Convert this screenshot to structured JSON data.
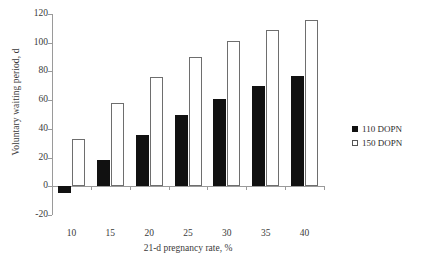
{
  "chart_data": {
    "type": "bar",
    "title": "",
    "xlabel": "21-d pregnancy rate, %",
    "ylabel": "Voluntary waiting period, d",
    "categories": [
      "10",
      "15",
      "20",
      "25",
      "30",
      "35",
      "40"
    ],
    "ylim": [
      -20,
      120
    ],
    "ytick_labels": [
      "-20",
      "0",
      "20",
      "40",
      "60",
      "80",
      "100",
      "120"
    ],
    "ytick_values": [
      -20,
      0,
      20,
      40,
      60,
      80,
      100,
      120
    ],
    "grid": false,
    "legend_position": "right-middle",
    "series": [
      {
        "name": "110 DOPN",
        "style": "filled-black",
        "color": "#111111",
        "values": [
          -5,
          18,
          36,
          50,
          61,
          70,
          77
        ]
      },
      {
        "name": "150 DOPN",
        "style": "open-white",
        "color": "#ffffff",
        "border_color": "#6e6e6e",
        "values": [
          33,
          58,
          76,
          90,
          101,
          109,
          116
        ]
      }
    ]
  },
  "legend": {
    "items": [
      {
        "label": "110 DOPN",
        "style": "filled"
      },
      {
        "label": "150 DOPN",
        "style": "open"
      }
    ]
  }
}
